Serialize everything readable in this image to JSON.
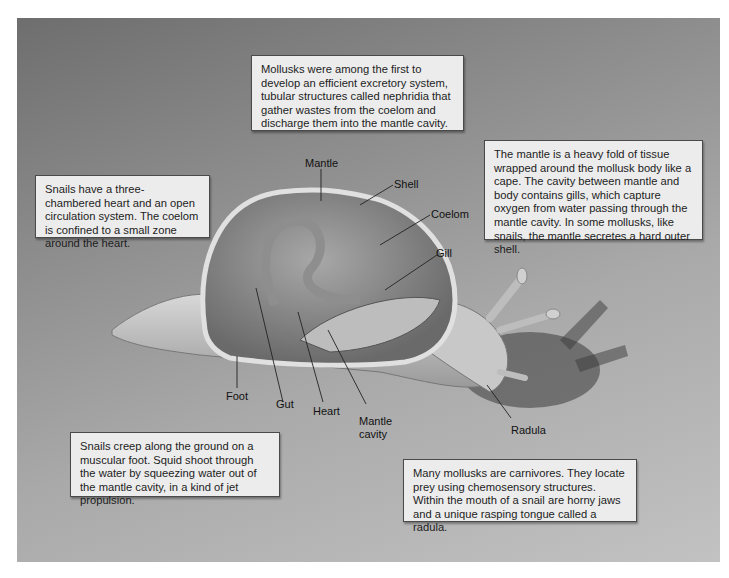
{
  "figure": {
    "colors": {
      "panel_dark": "#6e6e6e",
      "panel_light": "#c2c2c2",
      "box_fill": "#ececec",
      "box_border": "#4a4a4a"
    }
  },
  "callouts": {
    "excretory": "Mollusks were among the first to develop an efficient excretory system, tubular structures called nephridia that gather wastes from the coelom and discharge them into the mantle cavity.",
    "circulation": "Snails have a three-chambered heart and an open circulation system. The coelom is confined to a small zone around the heart.",
    "mantle": "The mantle is a heavy fold of tissue wrapped around the mollusk body like a cape. The cavity between mantle and body contains gills, which capture oxygen from water passing through the mantle cavity. In some mollusks, like snails, the mantle secretes a hard outer shell.",
    "foot": "Snails creep along the ground on a muscular foot. Squid shoot through the water by squeezing water out of the mantle cavity, in a kind of jet propulsion.",
    "radula": "Many mollusks are carnivores. They locate prey using chemosensory structures. Within the mouth of a snail are horny jaws and a unique rasping tongue called a radula."
  },
  "labels": {
    "mantle": "Mantle",
    "shell": "Shell",
    "coelom": "Coelom",
    "gill": "Gill",
    "foot": "Foot",
    "gut": "Gut",
    "heart": "Heart",
    "mantle_cavity_1": "Mantle",
    "mantle_cavity_2": "cavity",
    "radula": "Radula"
  }
}
